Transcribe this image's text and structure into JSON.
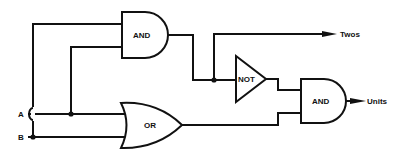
{
  "diagram": {
    "type": "logic-circuit",
    "inputs": [
      {
        "id": "A",
        "label": "A"
      },
      {
        "id": "B",
        "label": "B"
      }
    ],
    "gates": [
      {
        "id": "and1",
        "type": "AND",
        "label": "AND",
        "inputs": [
          "A",
          "B"
        ],
        "output": "and1_out"
      },
      {
        "id": "or1",
        "type": "OR",
        "label": "OR",
        "inputs": [
          "A",
          "B"
        ],
        "output": "or1_out"
      },
      {
        "id": "not1",
        "type": "NOT",
        "label": "NOT",
        "inputs": [
          "and1_out"
        ],
        "output": "not1_out"
      },
      {
        "id": "and2",
        "type": "AND",
        "label": "AND",
        "inputs": [
          "not1_out",
          "or1_out"
        ],
        "output": "Units"
      }
    ],
    "outputs": [
      {
        "id": "twos",
        "label": "Twos",
        "source": "and1_out"
      },
      {
        "id": "units",
        "label": "Units",
        "source": "and2"
      }
    ]
  }
}
